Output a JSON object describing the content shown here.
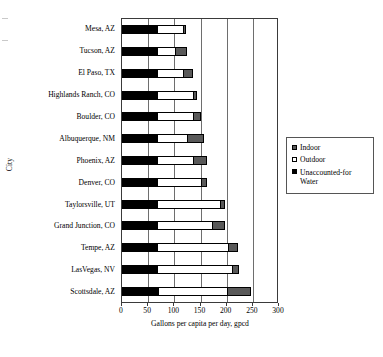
{
  "chart_data": {
    "type": "bar",
    "orientation": "horizontal",
    "stacked": true,
    "title": "",
    "xlabel": "Gallons per capita per day, gpcd",
    "ylabel": "City",
    "xlim": [
      0,
      300
    ],
    "xticks": [
      0,
      50,
      100,
      150,
      200,
      250,
      300
    ],
    "xtick_labels": [
      "0",
      "50",
      "100",
      "150",
      "200",
      "250",
      "300"
    ],
    "grid": "vertical",
    "legend_position": "right",
    "categories": [
      "Mesa, AZ",
      "Tucson, AZ",
      "El Paso, TX",
      "Highlands Ranch, CO",
      "Boulder, CO",
      "Albuquerque, NM",
      "Phoenix, AZ",
      "Denver, CO",
      "Taylorsville, UT",
      "Grand Junction, CO",
      "Tempe, AZ",
      "LasVegas, NV",
      "Scottsdale, AZ"
    ],
    "series": [
      {
        "name": "Unaccounted-for Water",
        "color": "#000000",
        "values": [
          67,
          67,
          67,
          67,
          67,
          67,
          67,
          67,
          67,
          67,
          67,
          67,
          68
        ]
      },
      {
        "name": "Outdoor",
        "color": "#ffffff",
        "values": [
          50,
          35,
          50,
          68,
          68,
          57,
          68,
          84,
          120,
          105,
          135,
          143,
          133
        ]
      },
      {
        "name": "Indoor",
        "color": "#595959",
        "values": [
          5,
          22,
          18,
          9,
          16,
          32,
          28,
          12,
          9,
          24,
          20,
          14,
          45
        ]
      }
    ],
    "totals": [
      122,
      124,
      135,
      144,
      151,
      156,
      163,
      163,
      196,
      196,
      222,
      224,
      246
    ]
  },
  "legend": {
    "items": [
      {
        "label": "Indoor",
        "swatch": "indoor-swatch"
      },
      {
        "label": "Outdoor",
        "swatch": "outdoor-swatch"
      },
      {
        "label": "Unaccounted-for Water",
        "swatch": "unaccounted-for-water-swatch"
      }
    ]
  },
  "axes": {
    "x_title": "Gallons per capita per day, gpcd",
    "y_title": "City"
  }
}
